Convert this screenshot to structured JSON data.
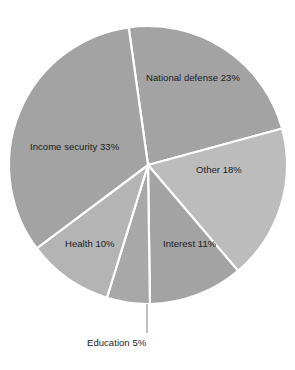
{
  "chart_data": {
    "type": "pie",
    "title": "",
    "subtitle": "",
    "xlabel": "",
    "ylabel": "",
    "legend_position": "none",
    "grid": false,
    "labels_placement": "inside-slices-with-leader-for-small",
    "total_percent": 100,
    "start_angle_deg": -8,
    "direction": "clockwise",
    "categories": [
      "National defense",
      "Other",
      "Interest",
      "Education",
      "Health",
      "Income security"
    ],
    "values": [
      23,
      18,
      11,
      5,
      10,
      33
    ],
    "slices": [
      {
        "name": "National defense",
        "value": 23,
        "label": "National defense 23%",
        "color": "#a3a3a3",
        "label_position": "inside"
      },
      {
        "name": "Other",
        "value": 18,
        "label": "Other 18%",
        "color": "#bcbcbc",
        "label_position": "inside"
      },
      {
        "name": "Interest",
        "value": 11,
        "label": "Interest 11%",
        "color": "#a3a3a3",
        "label_position": "inside"
      },
      {
        "name": "Education",
        "value": 5,
        "label": "Education 5%",
        "color": "#a8a8a8",
        "label_position": "outside-leader"
      },
      {
        "name": "Health",
        "value": 10,
        "label": "Health 10%",
        "color": "#b4b4b4",
        "label_position": "inside"
      },
      {
        "name": "Income security",
        "value": 33,
        "label": "Income security 33%",
        "color": "#a3a3a3",
        "label_position": "inside"
      }
    ],
    "colors": {
      "background": "#ffffff",
      "separator": "#ffffff",
      "text": "#1b1b1b",
      "leader": "#8a8a8a",
      "slice_mid_gray": "#a3a3a3",
      "slice_light_gray": "#bcbcbc"
    },
    "geometry": {
      "center_x": 148,
      "center_y": 165,
      "radius": 139
    }
  },
  "labels": {
    "national_defense": "National defense 23%",
    "income_security": "Income security 33%",
    "other": "Other 18%",
    "health": "Health 10%",
    "interest": "Interest 11%",
    "education": "Education 5%"
  }
}
